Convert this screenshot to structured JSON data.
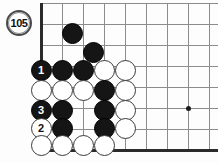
{
  "figure": {
    "label": "105",
    "label_name": "diagram-number-badge"
  },
  "board": {
    "grid_spacing": 21,
    "origin_x": 41,
    "origin_y": 3,
    "cols": 9,
    "rows": 8,
    "edges": {
      "left": true,
      "bottom": true,
      "top": false,
      "right": false
    },
    "hoshi": [
      {
        "cx": 188,
        "cy": 108
      }
    ]
  },
  "stones": [
    {
      "color": "black",
      "cx": 72,
      "cy": 33,
      "label": ""
    },
    {
      "color": "black",
      "cx": 93,
      "cy": 52,
      "label": ""
    },
    {
      "color": "black",
      "cx": 41,
      "cy": 70,
      "label": "1"
    },
    {
      "color": "black",
      "cx": 62,
      "cy": 70,
      "label": ""
    },
    {
      "color": "black",
      "cx": 83,
      "cy": 70,
      "label": ""
    },
    {
      "color": "white",
      "cx": 104,
      "cy": 70,
      "label": ""
    },
    {
      "color": "white",
      "cx": 125,
      "cy": 70,
      "label": ""
    },
    {
      "color": "white",
      "cx": 41,
      "cy": 90,
      "label": ""
    },
    {
      "color": "white",
      "cx": 62,
      "cy": 90,
      "label": ""
    },
    {
      "color": "white",
      "cx": 83,
      "cy": 90,
      "label": ""
    },
    {
      "color": "black",
      "cx": 104,
      "cy": 90,
      "label": ""
    },
    {
      "color": "white",
      "cx": 125,
      "cy": 90,
      "label": ""
    },
    {
      "color": "black",
      "cx": 41,
      "cy": 110,
      "label": "3"
    },
    {
      "color": "black",
      "cx": 62,
      "cy": 110,
      "label": ""
    },
    {
      "color": "black",
      "cx": 104,
      "cy": 110,
      "label": ""
    },
    {
      "color": "white",
      "cx": 125,
      "cy": 110,
      "label": ""
    },
    {
      "color": "white",
      "cx": 41,
      "cy": 128,
      "label": "2"
    },
    {
      "color": "black",
      "cx": 62,
      "cy": 128,
      "label": ""
    },
    {
      "color": "black",
      "cx": 104,
      "cy": 128,
      "label": ""
    },
    {
      "color": "white",
      "cx": 125,
      "cy": 128,
      "label": ""
    },
    {
      "color": "white",
      "cx": 41,
      "cy": 145,
      "label": ""
    },
    {
      "color": "white",
      "cx": 62,
      "cy": 145,
      "label": ""
    },
    {
      "color": "white",
      "cx": 83,
      "cy": 145,
      "label": ""
    },
    {
      "color": "white",
      "cx": 104,
      "cy": 145,
      "label": ""
    }
  ],
  "colors": {
    "black_stone": "#151515",
    "white_stone": "#ffffff",
    "grid": "#8c8c8c",
    "border": "#2b2b2b",
    "background": "#fdfdfd"
  }
}
